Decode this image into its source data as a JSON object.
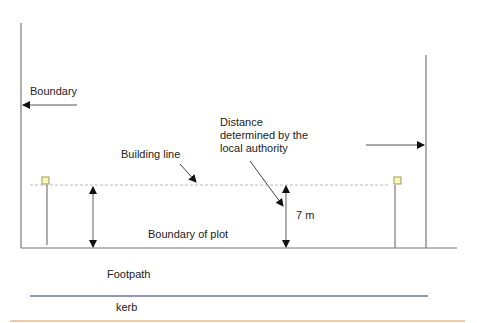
{
  "diagram": {
    "labels": {
      "boundary_left": "Boundary",
      "building_line": "Building line",
      "distance_note_line1": "Distance",
      "distance_note_line2": "determined by the",
      "distance_note_line3": "local authority",
      "dimension": "7 m",
      "boundary_of_plot": "Boundary of plot",
      "footpath": "Footpath",
      "kerb": "kerb"
    },
    "colors": {
      "line": "#777777",
      "dashed": "#bbbbbb",
      "marker_fill": "#fff7b0",
      "marker_stroke": "#999966",
      "kerb_line": "#6a7aa0",
      "bottom_rule": "#e8b88a"
    }
  }
}
